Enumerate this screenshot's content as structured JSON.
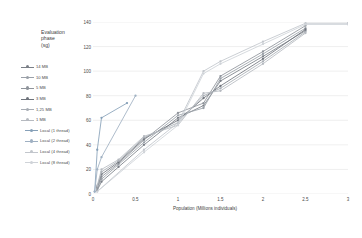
{
  "chart_data": {
    "type": "line",
    "title": "",
    "xlabel": "Population (Millions individuals)",
    "ylabel": "Evaluation phase (sg)",
    "ylabel_lines": [
      "Evaluation",
      "phase",
      "(sg)"
    ],
    "xlim": [
      0,
      3
    ],
    "ylim": [
      0,
      140
    ],
    "xticks": [
      "0",
      "0.5",
      "1",
      "1.5",
      "2",
      "2.5",
      "3"
    ],
    "xtick_values": [
      0,
      0.5,
      1,
      1.5,
      2,
      2.5,
      3
    ],
    "yticks": [
      "0",
      "20",
      "40",
      "60",
      "80",
      "100",
      "120",
      "140"
    ],
    "ytick_values": [
      0,
      20,
      40,
      60,
      80,
      100,
      120,
      140
    ],
    "grid": "horizontal",
    "legend_position": "left-outside",
    "series": [
      {
        "name": "14 MB",
        "color": "#7a7f87",
        "points": [
          [
            0.05,
            3
          ],
          [
            0.1,
            10
          ],
          [
            0.3,
            22
          ],
          [
            0.6,
            40
          ],
          [
            1.0,
            62
          ],
          [
            1.3,
            72
          ],
          [
            1.5,
            92
          ],
          [
            2.0,
            112
          ],
          [
            2.5,
            133
          ]
        ]
      },
      {
        "name": "10 MB",
        "color": "#9aa0a8",
        "points": [
          [
            0.05,
            4
          ],
          [
            0.1,
            12
          ],
          [
            0.3,
            24
          ],
          [
            0.6,
            42
          ],
          [
            1.0,
            64
          ],
          [
            1.3,
            70
          ],
          [
            1.5,
            94
          ],
          [
            2.0,
            114
          ],
          [
            2.5,
            135
          ]
        ]
      },
      {
        "name": "5 MB",
        "color": "#8f949b",
        "points": [
          [
            0.05,
            5
          ],
          [
            0.1,
            14
          ],
          [
            0.3,
            25
          ],
          [
            0.6,
            44
          ],
          [
            1.0,
            66
          ],
          [
            1.3,
            74
          ],
          [
            1.5,
            96
          ],
          [
            2.0,
            116
          ],
          [
            2.5,
            137
          ]
        ]
      },
      {
        "name": "3 MB",
        "color": "#6f747c",
        "points": [
          [
            0.05,
            6
          ],
          [
            0.1,
            16
          ],
          [
            0.3,
            26
          ],
          [
            0.6,
            45
          ],
          [
            1.0,
            60
          ],
          [
            1.3,
            78
          ],
          [
            1.5,
            88
          ],
          [
            2.0,
            110
          ],
          [
            2.5,
            134
          ]
        ]
      },
      {
        "name": "1,25 MB",
        "color": "#a8adb4",
        "points": [
          [
            0.05,
            6
          ],
          [
            0.1,
            18
          ],
          [
            0.3,
            27
          ],
          [
            0.6,
            46
          ],
          [
            1.0,
            58
          ],
          [
            1.3,
            80
          ],
          [
            1.5,
            86
          ],
          [
            2.0,
            108
          ],
          [
            2.5,
            132
          ]
        ]
      },
      {
        "name": "1 MB",
        "color": "#b6bac0",
        "points": [
          [
            0.05,
            7
          ],
          [
            0.1,
            20
          ],
          [
            0.3,
            28
          ],
          [
            0.6,
            47
          ],
          [
            1.0,
            56
          ],
          [
            1.3,
            82
          ],
          [
            1.5,
            84
          ],
          [
            2.0,
            106
          ],
          [
            2.5,
            131
          ]
        ]
      },
      {
        "name": "Local (1 thread)",
        "color": "#86a0b8",
        "points": [
          [
            0.02,
            2
          ],
          [
            0.05,
            36
          ],
          [
            0.1,
            62
          ],
          [
            0.4,
            74
          ]
        ]
      },
      {
        "name": "Local (2 thread)",
        "color": "#9fb0c2",
        "points": [
          [
            0.02,
            2
          ],
          [
            0.05,
            20
          ],
          [
            0.1,
            30
          ],
          [
            0.5,
            80
          ]
        ]
      },
      {
        "name": "Local (4 thread)",
        "color": "#c2c6cc",
        "points": [
          [
            0.05,
            2
          ],
          [
            0.6,
            36
          ],
          [
            1.0,
            58
          ],
          [
            1.3,
            100
          ],
          [
            1.5,
            108
          ],
          [
            2.0,
            124
          ],
          [
            2.5,
            139
          ],
          [
            3.0,
            139
          ]
        ]
      },
      {
        "name": "Local (8 thread)",
        "color": "#cfd3d8",
        "points": [
          [
            0.05,
            2
          ],
          [
            0.6,
            34
          ],
          [
            1.0,
            56
          ],
          [
            1.3,
            98
          ],
          [
            1.5,
            106
          ],
          [
            2.0,
            122
          ],
          [
            2.5,
            138
          ],
          [
            3.0,
            138
          ]
        ]
      }
    ]
  },
  "legend": {
    "items": [
      {
        "label": "14 MB"
      },
      {
        "label": "10 MB"
      },
      {
        "label": "5 MB"
      },
      {
        "label": "3 MB"
      },
      {
        "label": "1,25 MB"
      },
      {
        "label": "1 MB"
      },
      {
        "label": "Local (1 thread)"
      },
      {
        "label": "Local (2 thread)"
      },
      {
        "label": "Local (4 thread)"
      },
      {
        "label": "Local (8 thread)"
      }
    ]
  },
  "style": {
    "grid_color": "#e4e4e4",
    "text_color": "#4a4a4a",
    "background": "#ffffff"
  }
}
